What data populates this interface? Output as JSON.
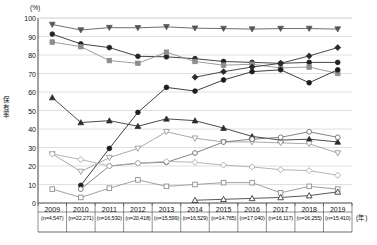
{
  "chart": {
    "y_unit": "(%)",
    "x_unit": "(年)",
    "y_axis_title": "保有率",
    "y_ticks": [
      "0",
      "10",
      "20",
      "30",
      "40",
      "50",
      "60",
      "70",
      "80",
      "90",
      "100"
    ],
    "x_labels": [
      {
        "year": "2009",
        "n": "(n=4,547)"
      },
      {
        "year": "2010",
        "n": "(n=22,271)"
      },
      {
        "year": "2011",
        "n": "(n=16,530)"
      },
      {
        "year": "2012",
        "n": "(n=20,418)"
      },
      {
        "year": "2013",
        "n": "(n=15,599)"
      },
      {
        "year": "2014",
        "n": "(n=16,529)"
      },
      {
        "year": "2015",
        "n": "(n=14,765)"
      },
      {
        "year": "2016",
        "n": "(n=17,040)"
      },
      {
        "year": "2017",
        "n": "(n=16,117)"
      },
      {
        "year": "2018",
        "n": "(n=16,255)"
      },
      {
        "year": "2019",
        "n": "(n=15,410)"
      }
    ]
  },
  "chart_data": {
    "type": "line",
    "title": "",
    "xlabel": "(年)",
    "ylabel": "保有率",
    "ylim": [
      0,
      100
    ],
    "ytick_step": 10,
    "grid": true,
    "legend": "none",
    "x": [
      "2009",
      "2010",
      "2011",
      "2012",
      "2013",
      "2014",
      "2015",
      "2016",
      "2017",
      "2018",
      "2019"
    ],
    "series": [
      {
        "name": "series-filled-down-triangle",
        "marker": "filled-down-triangle",
        "color": "#555555",
        "values": [
          96.5,
          93.5,
          94.8,
          94.7,
          95.2,
          94.5,
          94.3,
          94.0,
          94.3,
          94.3,
          94.0
        ]
      },
      {
        "name": "series-filled-circle",
        "marker": "filled-circle",
        "color": "#222222",
        "values": [
          91.3,
          86.0,
          84.0,
          79.3,
          79.0,
          78.0,
          76.5,
          76.0,
          75.5,
          76.0,
          76.0
        ]
      },
      {
        "name": "series-filled-square",
        "marker": "filled-square",
        "color": "#8c8c8c",
        "values": [
          87.0,
          84.5,
          77.0,
          75.5,
          81.5,
          76.5,
          74.5,
          75.0,
          73.0,
          73.5,
          70.0
        ]
      },
      {
        "name": "series-filled-diamond",
        "marker": "filled-diamond",
        "color": "#2b2b2b",
        "values": [
          null,
          null,
          null,
          null,
          null,
          68.0,
          71.0,
          73.5,
          75.5,
          79.5,
          84.0
        ]
      },
      {
        "name": "series-filled-up-triangle",
        "marker": "filled-up-triangle",
        "color": "#2b2b2b",
        "values": [
          57.0,
          43.5,
          44.5,
          41.5,
          45.5,
          44.5,
          40.5,
          36.0,
          34.0,
          34.5,
          33.0
        ]
      },
      {
        "name": "series-dark-circle-rise",
        "marker": "filled-circle",
        "color": "#1c1c1c",
        "values": [
          null,
          9.5,
          29.5,
          49.0,
          62.5,
          60.5,
          66.5,
          71.0,
          72.0,
          65.0,
          72.0
        ]
      },
      {
        "name": "series-open-down-triangle",
        "marker": "open-down-triangle",
        "color": "#9a9a9a",
        "values": [
          26.5,
          17.0,
          24.5,
          29.5,
          38.5,
          35.0,
          33.0,
          33.0,
          32.5,
          32.0,
          27.0
        ]
      },
      {
        "name": "series-open-circle",
        "marker": "open-circle",
        "color": "#6f6f6f",
        "values": [
          null,
          7.5,
          20.0,
          21.5,
          22.0,
          27.0,
          33.0,
          34.5,
          35.5,
          38.5,
          35.5
        ]
      },
      {
        "name": "series-open-diamond",
        "marker": "open-diamond",
        "color": "#a8a8a8",
        "values": [
          26.5,
          23.5,
          20.0,
          21.5,
          22.5,
          22.0,
          20.5,
          19.5,
          18.0,
          17.5,
          15.0
        ]
      },
      {
        "name": "series-open-square",
        "marker": "open-square",
        "color": "#8f8f8f",
        "values": [
          7.5,
          3.0,
          8.0,
          12.5,
          9.0,
          10.0,
          11.0,
          11.0,
          5.5,
          9.0,
          7.5
        ]
      },
      {
        "name": "series-open-up-triangle",
        "marker": "open-up-triangle",
        "color": "#3a3a3a",
        "values": [
          null,
          null,
          null,
          null,
          null,
          1.5,
          2.0,
          2.5,
          3.0,
          4.0,
          6.0
        ]
      }
    ]
  }
}
